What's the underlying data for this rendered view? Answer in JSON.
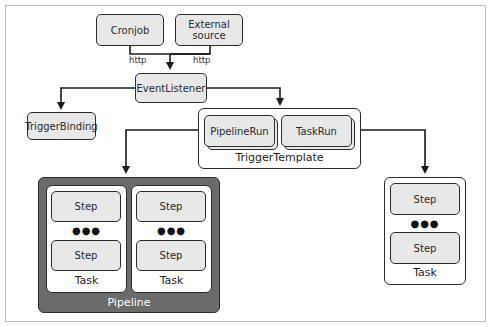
{
  "diagram": {
    "sources": [
      {
        "label": "Cronjob"
      },
      {
        "label": "External\nsource"
      }
    ],
    "connection_labels": [
      "http",
      "http"
    ],
    "event_listener": {
      "label": "EventListener"
    },
    "trigger_binding": {
      "label": "TriggerBinding"
    },
    "trigger_template": {
      "label": "TriggerTemplate",
      "items": [
        {
          "label": "PipelineRun"
        },
        {
          "label": "TaskRun"
        }
      ]
    },
    "pipeline": {
      "label": "Pipeline",
      "tasks": [
        {
          "label": "Task",
          "steps": [
            {
              "label": "Step"
            },
            {
              "label": "Step"
            }
          ],
          "ellipsis": "●●●"
        },
        {
          "label": "Task",
          "steps": [
            {
              "label": "Step"
            },
            {
              "label": "Step"
            }
          ],
          "ellipsis": "●●●"
        }
      ]
    },
    "standalone_task": {
      "label": "Task",
      "steps": [
        {
          "label": "Step"
        },
        {
          "label": "Step"
        }
      ],
      "ellipsis": "●●●"
    },
    "colors": {
      "node_fill": "#e8e8e8",
      "stroke": "#2b2b2b",
      "pipeline_fill": "#6b6b6b",
      "pipeline_text": "#ffffff"
    }
  }
}
